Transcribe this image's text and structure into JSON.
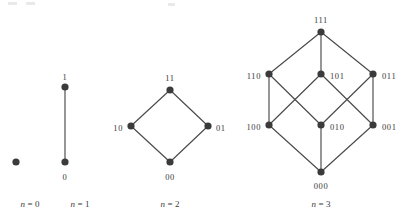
{
  "figure": {
    "vertex_color": "#3b3b3b",
    "edge_color": "#4a4a4a",
    "background_color": "#ffffff"
  },
  "diagrams": [
    {
      "id": "n0",
      "caption": "n = 0",
      "caption_var": "n",
      "caption_rest": "= 0",
      "caption_x": 30,
      "caption_y": 207,
      "vertices": [
        {
          "label": "",
          "x": 16,
          "y": 162,
          "label_x": 16,
          "label_y": 162,
          "anchor": "middle"
        }
      ],
      "edges": []
    },
    {
      "id": "n1",
      "caption": "n = 1",
      "caption_var": "n",
      "caption_rest": "= 1",
      "caption_x": 80,
      "caption_y": 207,
      "vertices": [
        {
          "label": "1",
          "x": 65,
          "y": 87,
          "label_x": 65,
          "label_y": 78,
          "anchor": "middle"
        },
        {
          "label": "0",
          "x": 65,
          "y": 162,
          "label_x": 65,
          "label_y": 178,
          "anchor": "middle"
        }
      ],
      "edges": [
        {
          "from": "1",
          "to": "0",
          "x1": 65,
          "y1": 87,
          "x2": 65,
          "y2": 162
        }
      ]
    },
    {
      "id": "n2",
      "caption": "n = 2",
      "caption_var": "n",
      "caption_rest": "= 2",
      "caption_x": 170,
      "caption_y": 207,
      "vertices": [
        {
          "label": "11",
          "x": 170,
          "y": 90,
          "label_x": 170,
          "label_y": 79,
          "anchor": "middle"
        },
        {
          "label": "10",
          "x": 131,
          "y": 126,
          "label_x": 123,
          "label_y": 129,
          "anchor": "end"
        },
        {
          "label": "01",
          "x": 208,
          "y": 126,
          "label_x": 216,
          "label_y": 129,
          "anchor": "start"
        },
        {
          "label": "00",
          "x": 170,
          "y": 162,
          "label_x": 170,
          "label_y": 178,
          "anchor": "middle"
        }
      ],
      "edges": [
        {
          "from": "11",
          "to": "10",
          "x1": 170,
          "y1": 90,
          "x2": 131,
          "y2": 126
        },
        {
          "from": "11",
          "to": "01",
          "x1": 170,
          "y1": 90,
          "x2": 208,
          "y2": 126
        },
        {
          "from": "10",
          "to": "00",
          "x1": 131,
          "y1": 126,
          "x2": 170,
          "y2": 162
        },
        {
          "from": "01",
          "to": "00",
          "x1": 208,
          "y1": 126,
          "x2": 170,
          "y2": 162
        }
      ]
    },
    {
      "id": "n3",
      "caption": "n = 3",
      "caption_var": "n",
      "caption_rest": "= 3",
      "caption_x": 321,
      "caption_y": 207,
      "vertices": [
        {
          "label": "111",
          "x": 321,
          "y": 32,
          "label_x": 321,
          "label_y": 21,
          "anchor": "middle"
        },
        {
          "label": "110",
          "x": 269,
          "y": 74,
          "label_x": 261,
          "label_y": 77,
          "anchor": "end"
        },
        {
          "label": "101",
          "x": 321,
          "y": 74,
          "label_x": 330,
          "label_y": 77,
          "anchor": "start"
        },
        {
          "label": "011",
          "x": 373,
          "y": 74,
          "label_x": 382,
          "label_y": 77,
          "anchor": "start"
        },
        {
          "label": "100",
          "x": 269,
          "y": 125,
          "label_x": 261,
          "label_y": 128,
          "anchor": "end"
        },
        {
          "label": "010",
          "x": 321,
          "y": 125,
          "label_x": 330,
          "label_y": 128,
          "anchor": "start"
        },
        {
          "label": "001",
          "x": 373,
          "y": 125,
          "label_x": 382,
          "label_y": 128,
          "anchor": "start"
        },
        {
          "label": "000",
          "x": 321,
          "y": 172,
          "label_x": 321,
          "label_y": 187,
          "anchor": "middle"
        }
      ],
      "edges": [
        {
          "from": "111",
          "to": "110",
          "x1": 321,
          "y1": 32,
          "x2": 269,
          "y2": 74
        },
        {
          "from": "111",
          "to": "101",
          "x1": 321,
          "y1": 32,
          "x2": 321,
          "y2": 74
        },
        {
          "from": "111",
          "to": "011",
          "x1": 321,
          "y1": 32,
          "x2": 373,
          "y2": 74
        },
        {
          "from": "110",
          "to": "100",
          "x1": 269,
          "y1": 74,
          "x2": 269,
          "y2": 125
        },
        {
          "from": "110",
          "to": "010",
          "x1": 269,
          "y1": 74,
          "x2": 321,
          "y2": 125
        },
        {
          "from": "101",
          "to": "100",
          "x1": 321,
          "y1": 74,
          "x2": 269,
          "y2": 125
        },
        {
          "from": "101",
          "to": "001",
          "x1": 321,
          "y1": 74,
          "x2": 373,
          "y2": 125
        },
        {
          "from": "011",
          "to": "010",
          "x1": 373,
          "y1": 74,
          "x2": 321,
          "y2": 125
        },
        {
          "from": "011",
          "to": "001",
          "x1": 373,
          "y1": 74,
          "x2": 373,
          "y2": 125
        },
        {
          "from": "100",
          "to": "000",
          "x1": 269,
          "y1": 125,
          "x2": 321,
          "y2": 172
        },
        {
          "from": "010",
          "to": "000",
          "x1": 321,
          "y1": 125,
          "x2": 321,
          "y2": 172
        },
        {
          "from": "001",
          "to": "000",
          "x1": 373,
          "y1": 125,
          "x2": 321,
          "y2": 172
        }
      ]
    }
  ],
  "specks": [
    {
      "x": 8,
      "y": 2,
      "w": 9,
      "h": 3
    },
    {
      "x": 26,
      "y": 2,
      "w": 9,
      "h": 3
    },
    {
      "x": 168,
      "y": 3,
      "w": 7,
      "h": 3
    }
  ]
}
